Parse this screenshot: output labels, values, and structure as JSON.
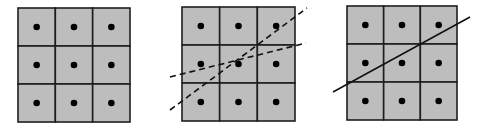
{
  "colors": {
    "background": "#ffffff",
    "cell_fill": "#bdbdbd",
    "grid_stroke": "#1e1e1e",
    "dot": "#000000",
    "line": "#111111"
  },
  "panels": [
    {
      "name": "grid-plain",
      "x": 18,
      "y": 8,
      "w": 112,
      "h": 114,
      "rows": 3,
      "cols": 3,
      "lines": []
    },
    {
      "name": "grid-dashed-lines",
      "x": 182,
      "y": 7,
      "w": 113,
      "h": 114,
      "rows": 3,
      "cols": 3,
      "lines": [
        {
          "x1": 170,
          "y1": 110,
          "x2": 307,
          "y2": 8,
          "style": "dashed"
        },
        {
          "x1": 170,
          "y1": 77,
          "x2": 306,
          "y2": 43,
          "style": "dashed"
        }
      ]
    },
    {
      "name": "grid-solid-line",
      "x": 347,
      "y": 6,
      "w": 110,
      "h": 114,
      "rows": 3,
      "cols": 3,
      "lines": [
        {
          "x1": 333,
          "y1": 92,
          "x2": 470,
          "y2": 17,
          "style": "solid"
        }
      ]
    }
  ]
}
